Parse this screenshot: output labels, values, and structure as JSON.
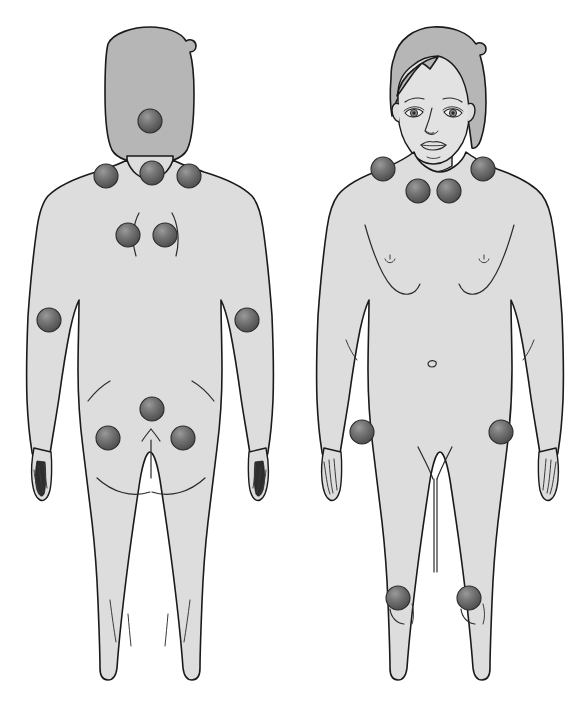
{
  "diagram": {
    "view_left_label": "posterior view",
    "view_right_label": "anterior view",
    "background_color": "#ffffff",
    "body_fill_color": "#dddddd",
    "hair_fill_color": "#b6b6b6",
    "outline_color": "#1a1a1a",
    "marker_color": "#5c5c5c",
    "marker_highlight_color": "#8a8a8a",
    "marker_count_total": 18,
    "marker_radius": 12
  },
  "figures": [
    {
      "id": "figure-posterior",
      "label": "posterior view",
      "marker_count": 10,
      "markers": [
        {
          "name": "occiput",
          "side": "center",
          "cx": 150,
          "cy": 121,
          "r": 12
        },
        {
          "name": "trapezius-left",
          "side": "left",
          "cx": 106,
          "cy": 176,
          "r": 12
        },
        {
          "name": "low-cervical-center",
          "side": "center",
          "cx": 152,
          "cy": 173,
          "r": 12
        },
        {
          "name": "trapezius-right",
          "side": "right",
          "cx": 189,
          "cy": 176,
          "r": 12
        },
        {
          "name": "supraspinatus-left",
          "side": "left",
          "cx": 128,
          "cy": 235,
          "r": 12
        },
        {
          "name": "supraspinatus-right",
          "side": "right",
          "cx": 165,
          "cy": 235,
          "r": 12
        },
        {
          "name": "lateral-epicondyle-left",
          "side": "left",
          "cx": 49,
          "cy": 320,
          "r": 12
        },
        {
          "name": "lateral-epicondyle-right",
          "side": "right",
          "cx": 247,
          "cy": 320,
          "r": 12
        },
        {
          "name": "sacrum",
          "side": "center",
          "cx": 152,
          "cy": 409,
          "r": 12
        },
        {
          "name": "gluteal-left",
          "side": "left",
          "cx": 108,
          "cy": 438,
          "r": 12
        },
        {
          "name": "gluteal-right",
          "side": "right",
          "cx": 183,
          "cy": 438,
          "r": 12
        }
      ]
    },
    {
      "id": "figure-anterior",
      "label": "anterior view",
      "marker_count": 8,
      "markers": [
        {
          "name": "trapezius-upper-left",
          "side": "left",
          "cx": 383,
          "cy": 169,
          "r": 12
        },
        {
          "name": "trapezius-upper-right",
          "side": "right",
          "cx": 483,
          "cy": 169,
          "r": 12
        },
        {
          "name": "second-rib-left",
          "side": "left",
          "cx": 418,
          "cy": 191,
          "r": 12
        },
        {
          "name": "second-rib-right",
          "side": "right",
          "cx": 449,
          "cy": 191,
          "r": 12
        },
        {
          "name": "greater-trochanter-left",
          "side": "left",
          "cx": 362,
          "cy": 432,
          "r": 12
        },
        {
          "name": "greater-trochanter-right",
          "side": "right",
          "cx": 501,
          "cy": 432,
          "r": 12
        },
        {
          "name": "knee-medial-left",
          "side": "left",
          "cx": 398,
          "cy": 598,
          "r": 12
        },
        {
          "name": "knee-medial-right",
          "side": "right",
          "cx": 469,
          "cy": 598,
          "r": 12
        }
      ]
    }
  ]
}
